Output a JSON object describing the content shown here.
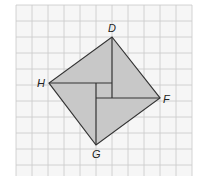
{
  "diagram": {
    "type": "geometry-grid",
    "grid": {
      "x0": 16,
      "y0": 5,
      "x1": 192,
      "y1": 176,
      "cell": 16,
      "line_color": "#c9c9c9",
      "bg": "#f6f6f6"
    },
    "square": {
      "fill": "#c8c8c8",
      "stroke": "#333333",
      "vertices": {
        "D": {
          "x": 112,
          "y": 37
        },
        "F": {
          "x": 160,
          "y": 98
        },
        "G": {
          "x": 96,
          "y": 145
        },
        "H": {
          "x": 49,
          "y": 83
        }
      }
    },
    "inner_segments": [
      {
        "from": "H",
        "to": [
          112,
          83
        ]
      },
      {
        "from": "D",
        "to": [
          112,
          98
        ]
      },
      {
        "from": "F",
        "to": [
          96,
          98
        ]
      },
      {
        "from": "G",
        "to": [
          96,
          83
        ]
      }
    ],
    "labels": {
      "D": "D",
      "F": "F",
      "G": "G",
      "H": "H"
    }
  }
}
